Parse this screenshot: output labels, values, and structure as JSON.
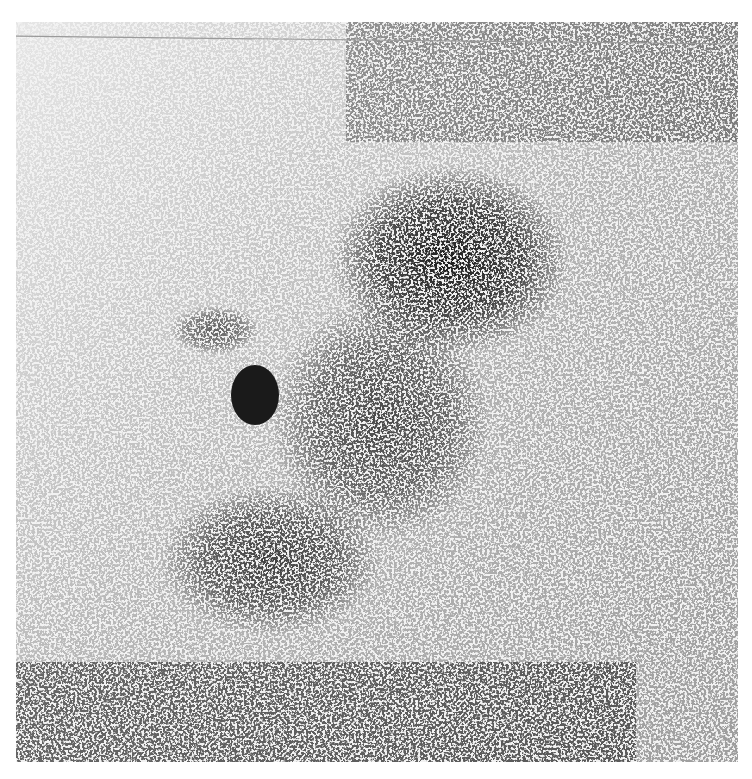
{
  "image": {
    "kind": "grayscale-scintigram",
    "background_color": "#f2f2f2",
    "ink_color": "#1a1a1a",
    "panel": {
      "x": 16,
      "y": 22,
      "width": 722,
      "height": 740
    },
    "regions": [
      {
        "name": "upper-mass",
        "cx": 450,
        "cy": 260,
        "rx": 120,
        "ry": 95,
        "density": 0.85
      },
      {
        "name": "central-mass",
        "cx": 380,
        "cy": 420,
        "rx": 110,
        "ry": 120,
        "density": 0.6
      },
      {
        "name": "lower-left-mass",
        "cx": 270,
        "cy": 560,
        "rx": 110,
        "ry": 75,
        "density": 0.65
      },
      {
        "name": "left-arm",
        "cx": 215,
        "cy": 330,
        "rx": 45,
        "ry": 25,
        "density": 0.5
      },
      {
        "name": "dense-spot",
        "cx": 255,
        "cy": 395,
        "rx": 24,
        "ry": 30,
        "density": 1.0
      }
    ]
  }
}
